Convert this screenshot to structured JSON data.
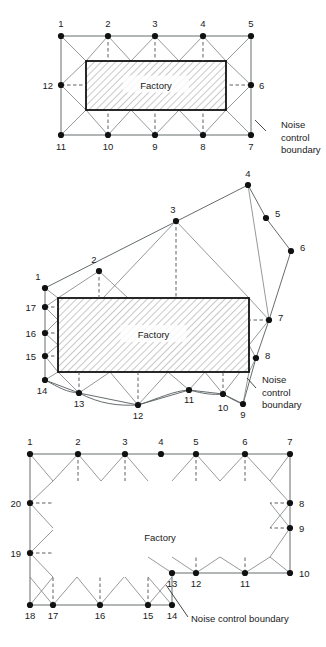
{
  "page": {
    "width": 326,
    "height": 647,
    "background": "#ffffff",
    "ink": "#1a1a1a",
    "line_color": "#555b5e",
    "ray_color": "#7a7f82",
    "hatch_color": "#9a9a9a",
    "factory_label": "Factory",
    "boundary_caption": "Noise control boundary"
  },
  "figures": [
    {
      "id": "figure-1",
      "name": "rectangular-factory-12-point-boundary",
      "factory_label": "Factory",
      "caption": "Noise control boundary",
      "caption_lines": [
        "Noise",
        "control",
        "boundary"
      ],
      "caption_x": 281,
      "caption_y": 128,
      "leader": {
        "x1": 266,
        "y1": 131,
        "x2": 255,
        "y2": 120
      },
      "factory_rect": {
        "x": 86,
        "y": 61,
        "w": 140,
        "h": 49
      },
      "boundary_path": "61,36 251,36 251,135 61,135 Z",
      "nodes": [
        {
          "n": "1",
          "x": 61,
          "y": 36,
          "lx": 61,
          "ly": 27,
          "anchor": "middle"
        },
        {
          "n": "2",
          "x": 108,
          "y": 36,
          "lx": 108,
          "ly": 27,
          "anchor": "middle"
        },
        {
          "n": "3",
          "x": 155,
          "y": 36,
          "lx": 155,
          "ly": 27,
          "anchor": "middle"
        },
        {
          "n": "4",
          "x": 203,
          "y": 36,
          "lx": 203,
          "ly": 27,
          "anchor": "middle"
        },
        {
          "n": "5",
          "x": 251,
          "y": 36,
          "lx": 251,
          "ly": 27,
          "anchor": "middle"
        },
        {
          "n": "6",
          "x": 251,
          "y": 85,
          "lx": 259,
          "ly": 89,
          "anchor": "start"
        },
        {
          "n": "7",
          "x": 251,
          "y": 135,
          "lx": 251,
          "ly": 150,
          "anchor": "middle"
        },
        {
          "n": "8",
          "x": 203,
          "y": 135,
          "lx": 203,
          "ly": 150,
          "anchor": "middle"
        },
        {
          "n": "9",
          "x": 155,
          "y": 135,
          "lx": 155,
          "ly": 150,
          "anchor": "middle"
        },
        {
          "n": "10",
          "x": 108,
          "y": 135,
          "lx": 108,
          "ly": 150,
          "anchor": "middle"
        },
        {
          "n": "11",
          "x": 61,
          "y": 135,
          "lx": 61,
          "ly": 150,
          "anchor": "middle"
        },
        {
          "n": "12",
          "x": 61,
          "y": 85,
          "lx": 53,
          "ly": 89,
          "anchor": "end"
        }
      ],
      "rays": [
        [
          108,
          36,
          86,
          61
        ],
        [
          108,
          36,
          131,
          61
        ],
        [
          155,
          36,
          131,
          61
        ],
        [
          155,
          36,
          179,
          61
        ],
        [
          203,
          36,
          179,
          61
        ],
        [
          203,
          36,
          226,
          61
        ],
        [
          61,
          36,
          86,
          61
        ],
        [
          251,
          36,
          226,
          61
        ],
        [
          61,
          85,
          86,
          61
        ],
        [
          61,
          85,
          86,
          110
        ],
        [
          251,
          85,
          226,
          61
        ],
        [
          251,
          85,
          226,
          110
        ],
        [
          108,
          135,
          86,
          110
        ],
        [
          108,
          135,
          131,
          110
        ],
        [
          155,
          135,
          131,
          110
        ],
        [
          155,
          135,
          179,
          110
        ],
        [
          203,
          135,
          179,
          110
        ],
        [
          203,
          135,
          226,
          110
        ],
        [
          61,
          135,
          86,
          110
        ],
        [
          251,
          135,
          226,
          110
        ]
      ],
      "dashes": [
        [
          108,
          36,
          108,
          61
        ],
        [
          155,
          36,
          155,
          61
        ],
        [
          203,
          36,
          203,
          61
        ],
        [
          61,
          85,
          86,
          85
        ],
        [
          251,
          85,
          226,
          85
        ],
        [
          108,
          135,
          108,
          110
        ],
        [
          155,
          135,
          155,
          110
        ],
        [
          203,
          135,
          203,
          110
        ]
      ]
    },
    {
      "id": "figure-2",
      "name": "irregular-boundary-17-point",
      "factory_label": "Factory",
      "caption": "Noise control boundary",
      "caption_lines": [
        "Noise",
        "control",
        "boundary"
      ],
      "caption_x": 262,
      "caption_y": 383,
      "leader": {
        "x1": 256,
        "y1": 388,
        "x2": 247,
        "y2": 378
      },
      "factory_rect": {
        "x": 58,
        "y": 298,
        "w": 191,
        "h": 74
      },
      "boundary_path": "45,288 248,185 266,218 291,251 269,320 256,358 243,404 223,394 189,390 138,405 79,393 45,380 45,288",
      "nodes": [
        {
          "n": "1",
          "x": 45,
          "y": 288,
          "lx": 38,
          "ly": 280,
          "anchor": "middle"
        },
        {
          "n": "2",
          "x": 99,
          "y": 271,
          "lx": 94,
          "ly": 263,
          "anchor": "middle"
        },
        {
          "n": "3",
          "x": 176,
          "y": 221,
          "lx": 173,
          "ly": 213,
          "anchor": "middle"
        },
        {
          "n": "4",
          "x": 248,
          "y": 185,
          "lx": 248,
          "ly": 177,
          "anchor": "middle"
        },
        {
          "n": "5",
          "x": 266,
          "y": 218,
          "lx": 275,
          "ly": 217,
          "anchor": "start"
        },
        {
          "n": "6",
          "x": 291,
          "y": 251,
          "lx": 300,
          "ly": 251,
          "anchor": "start"
        },
        {
          "n": "7",
          "x": 269,
          "y": 320,
          "lx": 278,
          "ly": 321,
          "anchor": "start"
        },
        {
          "n": "8",
          "x": 256,
          "y": 358,
          "lx": 265,
          "ly": 359,
          "anchor": "start"
        },
        {
          "n": "9",
          "x": 243,
          "y": 404,
          "lx": 243,
          "ly": 418,
          "anchor": "middle"
        },
        {
          "n": "10",
          "x": 223,
          "y": 394,
          "lx": 223,
          "ly": 411,
          "anchor": "middle"
        },
        {
          "n": "11",
          "x": 189,
          "y": 390,
          "lx": 189,
          "ly": 403,
          "anchor": "middle"
        },
        {
          "n": "12",
          "x": 138,
          "y": 405,
          "lx": 138,
          "ly": 419,
          "anchor": "middle"
        },
        {
          "n": "13",
          "x": 79,
          "y": 393,
          "lx": 79,
          "ly": 407,
          "anchor": "middle"
        },
        {
          "n": "14",
          "x": 45,
          "y": 380,
          "lx": 42,
          "ly": 394,
          "anchor": "middle"
        },
        {
          "n": "15",
          "x": 45,
          "y": 356,
          "lx": 36,
          "ly": 360,
          "anchor": "end"
        },
        {
          "n": "16",
          "x": 45,
          "y": 333,
          "lx": 36,
          "ly": 337,
          "anchor": "end"
        },
        {
          "n": "17",
          "x": 45,
          "y": 307,
          "lx": 36,
          "ly": 311,
          "anchor": "end"
        }
      ],
      "rays": [
        [
          45,
          288,
          58,
          298
        ],
        [
          99,
          271,
          58,
          298
        ],
        [
          99,
          271,
          128,
          298
        ],
        [
          176,
          221,
          103,
          298
        ],
        [
          176,
          221,
          249,
          298
        ],
        [
          248,
          185,
          269,
          320
        ],
        [
          269,
          320,
          249,
          298
        ],
        [
          269,
          320,
          249,
          345
        ],
        [
          256,
          358,
          249,
          345
        ],
        [
          256,
          358,
          249,
          372
        ],
        [
          243,
          404,
          249,
          372
        ],
        [
          223,
          394,
          205,
          372
        ],
        [
          223,
          394,
          240,
          372
        ],
        [
          189,
          390,
          168,
          372
        ],
        [
          189,
          390,
          205,
          372
        ],
        [
          138,
          405,
          110,
          372
        ],
        [
          138,
          405,
          168,
          372
        ],
        [
          79,
          393,
          58,
          372
        ],
        [
          79,
          393,
          110,
          372
        ],
        [
          45,
          380,
          58,
          372
        ],
        [
          45,
          356,
          58,
          345
        ],
        [
          45,
          356,
          58,
          372
        ],
        [
          45,
          333,
          58,
          320
        ],
        [
          45,
          333,
          58,
          345
        ],
        [
          45,
          307,
          58,
          298
        ],
        [
          45,
          307,
          58,
          320
        ]
      ],
      "dashes": [
        [
          99,
          271,
          99,
          298
        ],
        [
          176,
          221,
          176,
          298
        ],
        [
          269,
          320,
          249,
          320
        ],
        [
          45,
          307,
          58,
          307
        ],
        [
          45,
          333,
          58,
          333
        ],
        [
          45,
          356,
          58,
          356
        ],
        [
          256,
          358,
          249,
          358
        ],
        [
          79,
          393,
          79,
          372
        ],
        [
          138,
          405,
          138,
          372
        ],
        [
          223,
          394,
          223,
          372
        ]
      ],
      "curves": [
        "M45,380 C60,388 66,392 79,393",
        "M79,393 C100,404 118,406 138,405",
        "M138,405 C160,398 173,391 189,390",
        "M189,390 C205,394 212,395 223,394",
        "M223,394 C232,399 237,402 243,404"
      ]
    },
    {
      "id": "figure-3",
      "name": "u-shaped-factory-20-point-boundary",
      "factory_label": "Factory",
      "caption": "Noise control boundary",
      "caption_x": 191,
      "caption_y": 622,
      "leader": {
        "x1": 188,
        "y1": 617,
        "x2": 166,
        "y2": 585
      },
      "factory_path": "53,481 148,481 148,530 172,530 172,481 270,481 270,557 148,557 148,577 53,577 Z",
      "boundary_path": "30,454 290,454 290,573 172,573 172,605 30,605 Z",
      "nodes": [
        {
          "n": "1",
          "x": 30,
          "y": 454,
          "lx": 30,
          "ly": 445,
          "anchor": "middle"
        },
        {
          "n": "2",
          "x": 78,
          "y": 454,
          "lx": 78,
          "ly": 445,
          "anchor": "middle"
        },
        {
          "n": "3",
          "x": 125,
          "y": 454,
          "lx": 125,
          "ly": 445,
          "anchor": "middle"
        },
        {
          "n": "4",
          "x": 161,
          "y": 454,
          "lx": 161,
          "ly": 445,
          "anchor": "middle"
        },
        {
          "n": "5",
          "x": 196,
          "y": 454,
          "lx": 196,
          "ly": 445,
          "anchor": "middle"
        },
        {
          "n": "6",
          "x": 245,
          "y": 454,
          "lx": 245,
          "ly": 445,
          "anchor": "middle"
        },
        {
          "n": "7",
          "x": 290,
          "y": 454,
          "lx": 290,
          "ly": 445,
          "anchor": "middle"
        },
        {
          "n": "8",
          "x": 290,
          "y": 503,
          "lx": 299,
          "ly": 507,
          "anchor": "start"
        },
        {
          "n": "9",
          "x": 290,
          "y": 528,
          "lx": 299,
          "ly": 532,
          "anchor": "start"
        },
        {
          "n": "10",
          "x": 290,
          "y": 573,
          "lx": 299,
          "ly": 577,
          "anchor": "start"
        },
        {
          "n": "11",
          "x": 245,
          "y": 573,
          "lx": 245,
          "ly": 587,
          "anchor": "middle"
        },
        {
          "n": "12",
          "x": 196,
          "y": 573,
          "lx": 196,
          "ly": 587,
          "anchor": "middle"
        },
        {
          "n": "13",
          "x": 172,
          "y": 573,
          "lx": 172,
          "ly": 587,
          "anchor": "middle"
        },
        {
          "n": "14",
          "x": 172,
          "y": 605,
          "lx": 172,
          "ly": 619,
          "anchor": "middle"
        },
        {
          "n": "15",
          "x": 148,
          "y": 605,
          "lx": 148,
          "ly": 619,
          "anchor": "middle"
        },
        {
          "n": "16",
          "x": 100,
          "y": 605,
          "lx": 100,
          "ly": 619,
          "anchor": "middle"
        },
        {
          "n": "17",
          "x": 53,
          "y": 605,
          "lx": 53,
          "ly": 619,
          "anchor": "middle"
        },
        {
          "n": "18",
          "x": 30,
          "y": 605,
          "lx": 30,
          "ly": 619,
          "anchor": "middle"
        },
        {
          "n": "19",
          "x": 30,
          "y": 553,
          "lx": 21,
          "ly": 557,
          "anchor": "end"
        },
        {
          "n": "20",
          "x": 30,
          "y": 503,
          "lx": 21,
          "ly": 507,
          "anchor": "end"
        }
      ],
      "rays": [
        [
          30,
          454,
          53,
          481
        ],
        [
          78,
          454,
          53,
          481
        ],
        [
          78,
          454,
          101,
          481
        ],
        [
          125,
          454,
          101,
          481
        ],
        [
          125,
          454,
          148,
          481
        ],
        [
          196,
          454,
          172,
          481
        ],
        [
          196,
          454,
          220,
          481
        ],
        [
          245,
          454,
          220,
          481
        ],
        [
          245,
          454,
          270,
          481
        ],
        [
          290,
          454,
          270,
          481
        ],
        [
          290,
          503,
          270,
          481
        ],
        [
          290,
          503,
          270,
          528
        ],
        [
          290,
          528,
          270,
          503
        ],
        [
          290,
          528,
          270,
          557
        ],
        [
          290,
          573,
          270,
          557
        ],
        [
          245,
          573,
          220,
          557
        ],
        [
          245,
          573,
          270,
          557
        ],
        [
          196,
          573,
          172,
          557
        ],
        [
          196,
          573,
          220,
          557
        ],
        [
          172,
          573,
          148,
          557
        ],
        [
          172,
          605,
          148,
          577
        ],
        [
          148,
          605,
          125,
          577
        ],
        [
          148,
          605,
          172,
          577
        ],
        [
          100,
          605,
          77,
          577
        ],
        [
          100,
          605,
          124,
          577
        ],
        [
          53,
          605,
          30,
          577
        ],
        [
          53,
          605,
          77,
          577
        ],
        [
          30,
          605,
          53,
          577
        ],
        [
          30,
          553,
          53,
          530
        ],
        [
          30,
          553,
          53,
          577
        ],
        [
          30,
          503,
          53,
          481
        ],
        [
          30,
          503,
          53,
          528
        ]
      ],
      "dashes": [
        [
          78,
          454,
          78,
          481
        ],
        [
          125,
          454,
          125,
          481
        ],
        [
          196,
          454,
          196,
          481
        ],
        [
          245,
          454,
          245,
          481
        ],
        [
          290,
          503,
          270,
          503
        ],
        [
          290,
          528,
          270,
          528
        ],
        [
          30,
          503,
          53,
          503
        ],
        [
          30,
          553,
          53,
          553
        ],
        [
          245,
          573,
          245,
          557
        ],
        [
          196,
          573,
          196,
          557
        ],
        [
          148,
          605,
          148,
          577
        ],
        [
          100,
          605,
          100,
          577
        ],
        [
          53,
          605,
          53,
          577
        ]
      ]
    }
  ]
}
